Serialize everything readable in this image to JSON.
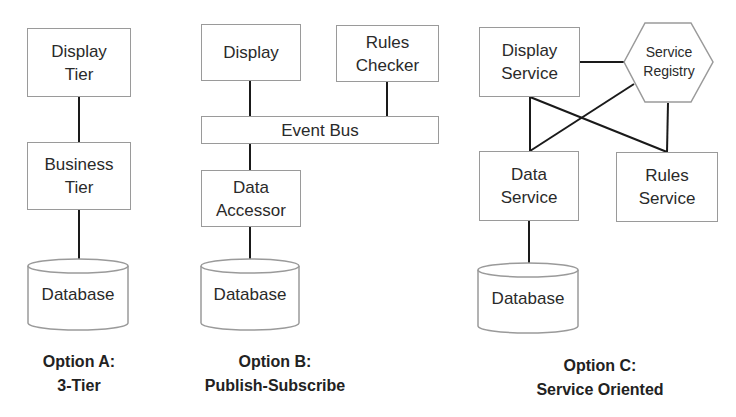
{
  "diagram": {
    "colors": {
      "line": "#1a1a1a",
      "shape_border": "#9a9a9a",
      "background": "#ffffff",
      "text": "#2a2a2a"
    },
    "option_a": {
      "nodes": {
        "display_tier": "Display\nTier",
        "business_tier": "Business\nTier",
        "database": "Database"
      },
      "caption": "Option A:\n3-Tier"
    },
    "option_b": {
      "nodes": {
        "display": "Display",
        "rules_checker": "Rules\nChecker",
        "event_bus": "Event Bus",
        "data_accessor": "Data\nAccessor",
        "database": "Database"
      },
      "caption": "Option B:\nPublish-Subscribe"
    },
    "option_c": {
      "nodes": {
        "display_service": "Display\nService",
        "service_registry": "Service\nRegistry",
        "data_service": "Data\nService",
        "rules_service": "Rules\nService",
        "database": "Database"
      },
      "caption": "Option C:\nService Oriented"
    },
    "edges": [
      [
        "Display Tier",
        "Business Tier"
      ],
      [
        "Business Tier",
        "Database"
      ],
      [
        "Display",
        "Event Bus"
      ],
      [
        "Rules Checker",
        "Event Bus"
      ],
      [
        "Event Bus",
        "Data Accessor"
      ],
      [
        "Data Accessor",
        "Database"
      ],
      [
        "Display Service",
        "Service Registry"
      ],
      [
        "Display Service",
        "Data Service"
      ],
      [
        "Display Service",
        "Rules Service"
      ],
      [
        "Service Registry",
        "Data Service"
      ],
      [
        "Service Registry",
        "Rules Service"
      ],
      [
        "Data Service",
        "Database"
      ]
    ]
  }
}
